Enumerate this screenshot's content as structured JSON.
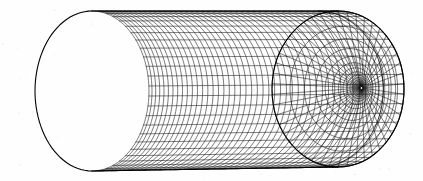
{
  "figure": {
    "title": "Wireframe mesh cylinder",
    "kind": "3d-wireframe-line-drawing",
    "background_color": "#fefefe",
    "line_color": "#111111",
    "silhouette_color": "#000000",
    "canvas": {
      "width": 423,
      "height": 181
    }
  },
  "geometry": {
    "description": "Right-circular cylinder drawn in oblique perspective. Axis runs from upper-left-far end to lower-right-near end. The near (right) end is closed by a meshed circular cap; the far (left) end shows only its elliptical rim.",
    "far_end": {
      "name": "left-rim",
      "center_x": 92,
      "center_y": 91,
      "radius_x": 57,
      "radius_y": 80,
      "note": "far elliptical rim, narrower because of perspective"
    },
    "near_end": {
      "name": "right-cap",
      "center_x": 338,
      "center_y": 89,
      "radius_x": 66,
      "radius_y": 78,
      "note": "near elliptical rim, the meshed end cap disc"
    },
    "cap_focus": {
      "name": "cap-vanishing-center",
      "x": 362,
      "y": 88,
      "note": "radial spokes of the cap converge toward this offset pole, producing the dense dark core"
    },
    "body_seam_x": 318,
    "left_extent_x": 33,
    "right_extent_x": 403,
    "top_extent_y": 13,
    "bottom_extent_y": 170
  },
  "mesh": {
    "lateral_surface": {
      "name": "cylinder-barrel-mesh",
      "circumferential_divisions": 46,
      "axial_divisions": 26,
      "circumferential_label": "ring lines (run around the cylinder, drawn as near-vertical arcs)",
      "axial_label": "generator lines (run along the cylinder length, drawn as shallow horizontal curves)",
      "stroke_width": 0.55
    },
    "end_cap": {
      "name": "end-cap-polar-mesh",
      "radial_spokes": 46,
      "concentric_rings": 17,
      "ring_spacing": "geometric, tightening toward the pole",
      "stroke_width": 0.55
    },
    "silhouette": {
      "name": "outer-silhouette",
      "stroke_width": 1.1
    }
  },
  "chart_data": {
    "type": "line",
    "title": "Wireframe mesh cylinder",
    "xlabel": "",
    "ylabel": "",
    "series": [
      {
        "name": "barrel-ring-lines",
        "count": 46
      },
      {
        "name": "barrel-generator-lines",
        "count": 26
      },
      {
        "name": "cap-radial-spokes",
        "count": 46
      },
      {
        "name": "cap-concentric-rings",
        "count": 17
      }
    ]
  }
}
